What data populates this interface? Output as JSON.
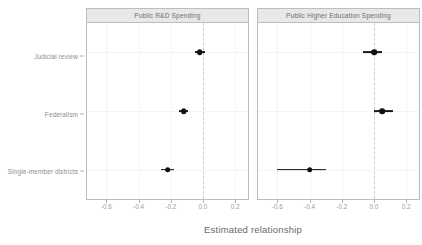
{
  "chart_data": {
    "type": "scatter",
    "title": "",
    "xlabel": "Estimated relationship",
    "ylabel": "",
    "xlim": [
      -0.72,
      0.28
    ],
    "xticks": [
      -0.6,
      -0.4,
      -0.2,
      0.0,
      0.2
    ],
    "xticklabels": [
      "-0.6",
      "-0.4",
      "-0.2",
      "0.0",
      "0.2"
    ],
    "categories": [
      "Judicial review",
      "Federalism",
      "Single-member districts"
    ],
    "grid": true,
    "legend": null,
    "reference_line": 0.0,
    "reference_line_style": "dashed",
    "panels": [
      {
        "label": "Public R&D Spending",
        "points": [
          {
            "category": "Judicial review",
            "estimate": -0.02,
            "low": -0.05,
            "high": 0.01
          },
          {
            "category": "Federalism",
            "estimate": -0.12,
            "low": -0.15,
            "high": -0.09
          },
          {
            "category": "Single-member districts",
            "estimate": -0.22,
            "low": -0.26,
            "high": -0.18
          }
        ]
      },
      {
        "label": "Public Higher Education Spending",
        "points": [
          {
            "category": "Judicial review",
            "estimate": 0.0,
            "low": -0.07,
            "high": 0.05
          },
          {
            "category": "Federalism",
            "estimate": 0.05,
            "low": 0.0,
            "high": 0.12
          },
          {
            "category": "Single-member districts",
            "estimate": -0.4,
            "low": -0.6,
            "high": -0.3
          }
        ]
      }
    ],
    "colors": {
      "point": "#111111",
      "errorbar": "#1a1a1a",
      "reference_line": "#d0d0d0",
      "panel_strip": "#e8e8e8",
      "panel_border": "#bdbdbd",
      "grid": "#f4f4f4",
      "text": "#8e8e8e"
    }
  }
}
